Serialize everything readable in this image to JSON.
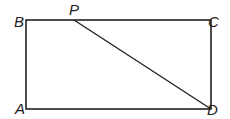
{
  "diagram": {
    "type": "geometry",
    "shape": "rectangle with diagonal segment",
    "points": {
      "A": {
        "label": "A",
        "x": 26,
        "y": 109
      },
      "B": {
        "label": "B",
        "x": 26,
        "y": 20
      },
      "C": {
        "label": "C",
        "x": 211,
        "y": 20
      },
      "D": {
        "label": "D",
        "x": 211,
        "y": 109
      },
      "P": {
        "label": "P",
        "x": 74,
        "y": 20
      }
    },
    "segments": [
      "AB",
      "BC",
      "CD",
      "DA",
      "PD"
    ],
    "colors": {
      "stroke": "#222222",
      "background": "#ffffff"
    }
  }
}
